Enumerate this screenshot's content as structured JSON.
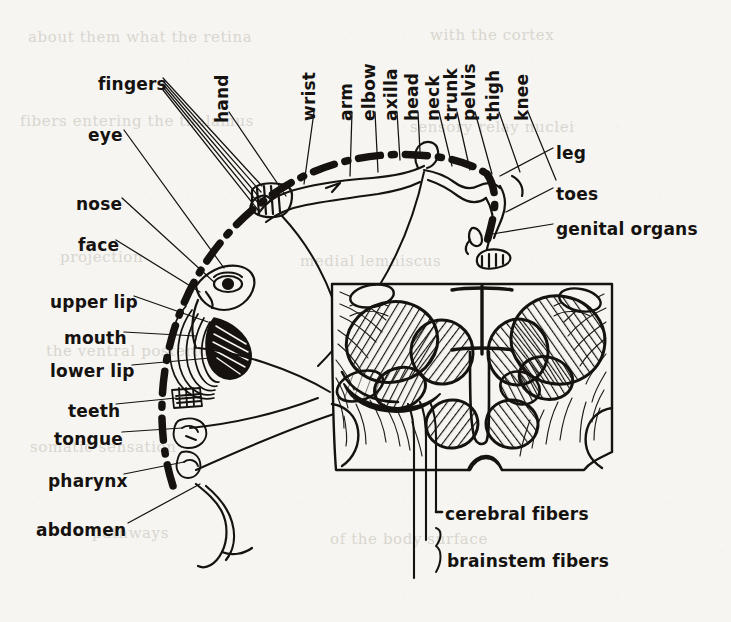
{
  "figure": {
    "type": "anatomical-diagram",
    "ink_color": "#15120f",
    "paper_color": "#f6f5f2"
  },
  "labels_left": [
    {
      "id": "fingers",
      "text": "fingers",
      "x": 98,
      "y": 76
    },
    {
      "id": "eye",
      "text": "eye",
      "x": 88,
      "y": 127
    },
    {
      "id": "nose",
      "text": "nose",
      "x": 76,
      "y": 196
    },
    {
      "id": "face",
      "text": "face",
      "x": 78,
      "y": 237
    },
    {
      "id": "upper-lip",
      "text": "upper lip",
      "x": 50,
      "y": 294
    },
    {
      "id": "mouth",
      "text": "mouth",
      "x": 64,
      "y": 330
    },
    {
      "id": "lower-lip",
      "text": "lower lip",
      "x": 50,
      "y": 363
    },
    {
      "id": "teeth",
      "text": "teeth",
      "x": 68,
      "y": 403
    },
    {
      "id": "tongue",
      "text": "tongue",
      "x": 54,
      "y": 431
    },
    {
      "id": "pharynx",
      "text": "pharynx",
      "x": 48,
      "y": 473
    },
    {
      "id": "abdomen",
      "text": "abdomen",
      "x": 36,
      "y": 522
    }
  ],
  "labels_top": [
    {
      "id": "hand",
      "text": "hand",
      "x": 231,
      "y": 106
    },
    {
      "id": "wrist",
      "text": "wrist",
      "x": 318,
      "y": 104
    },
    {
      "id": "arm",
      "text": "arm",
      "x": 355,
      "y": 104
    },
    {
      "id": "elbow",
      "text": "elbow",
      "x": 378,
      "y": 104
    },
    {
      "id": "axilla",
      "text": "axilla",
      "x": 400,
      "y": 104
    },
    {
      "id": "head",
      "text": "head",
      "x": 421,
      "y": 104
    },
    {
      "id": "neck",
      "text": "neck",
      "x": 442,
      "y": 104
    },
    {
      "id": "trunk",
      "text": "trunk",
      "x": 460,
      "y": 104
    },
    {
      "id": "pelvis",
      "text": "pelvis",
      "x": 478,
      "y": 104
    },
    {
      "id": "thigh",
      "text": "thigh",
      "x": 502,
      "y": 104
    },
    {
      "id": "knee",
      "text": "knee",
      "x": 531,
      "y": 104
    }
  ],
  "labels_right": [
    {
      "id": "leg",
      "text": "leg",
      "x": 556,
      "y": 145
    },
    {
      "id": "toes",
      "text": "toes",
      "x": 556,
      "y": 186
    },
    {
      "id": "genital-organs",
      "text": "genital organs",
      "x": 556,
      "y": 221
    }
  ],
  "labels_bottom": [
    {
      "id": "cerebral-fibers",
      "text": "cerebral fibers",
      "x": 445,
      "y": 506
    },
    {
      "id": "brainstem-fibers",
      "text": "brainstem fibers",
      "x": 447,
      "y": 553
    }
  ],
  "ghost_text": [
    {
      "text": "about  them  what  the  retina",
      "x": 28,
      "y": 28
    },
    {
      "text": "with  the  cortex",
      "x": 430,
      "y": 26
    },
    {
      "text": "fibers   entering   the   thalamus",
      "x": 20,
      "y": 112
    },
    {
      "text": "sensory   relay   nuclei",
      "x": 410,
      "y": 118
    },
    {
      "text": "projection",
      "x": 60,
      "y": 248
    },
    {
      "text": "medial   lemniscus",
      "x": 300,
      "y": 252
    },
    {
      "text": "the   ventral   posterior",
      "x": 46,
      "y": 342
    },
    {
      "text": "nucleus   of   the",
      "x": 330,
      "y": 348
    },
    {
      "text": "somatic   sensation",
      "x": 30,
      "y": 438
    },
    {
      "text": "cortical   areas",
      "x": 360,
      "y": 444
    },
    {
      "text": "pathways",
      "x": 92,
      "y": 524
    },
    {
      "text": "of   the   body   surface",
      "x": 330,
      "y": 530
    }
  ]
}
